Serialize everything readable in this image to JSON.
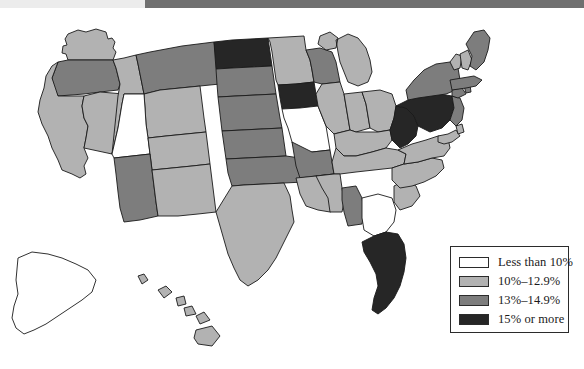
{
  "chart_data": {
    "type": "map",
    "title": "",
    "map_region": "United States",
    "value_label": "percent",
    "legend": {
      "position": "bottom-right",
      "bins": [
        {
          "label": "Less than 10%",
          "color": "#ffffff",
          "range": [
            0,
            9.9
          ]
        },
        {
          "label": "10%–12.9%",
          "color": "#b2b2b2",
          "range": [
            10,
            12.9
          ]
        },
        {
          "label": "13%–14.9%",
          "color": "#7d7d7d",
          "range": [
            13,
            14.9
          ]
        },
        {
          "label": "15% or more",
          "color": "#262626",
          "range": [
            15,
            100
          ]
        }
      ]
    },
    "states": [
      {
        "code": "AL",
        "name": "Alabama",
        "bin": 2,
        "color": "#7d7d7d"
      },
      {
        "code": "AK",
        "name": "Alaska",
        "bin": 0,
        "color": "#ffffff"
      },
      {
        "code": "AZ",
        "name": "Arizona",
        "bin": 2,
        "color": "#7d7d7d"
      },
      {
        "code": "AR",
        "name": "Arkansas",
        "bin": 2,
        "color": "#7d7d7d"
      },
      {
        "code": "CA",
        "name": "California",
        "bin": 1,
        "color": "#b2b2b2"
      },
      {
        "code": "CO",
        "name": "Colorado",
        "bin": 1,
        "color": "#b2b2b2"
      },
      {
        "code": "CT",
        "name": "Connecticut",
        "bin": 2,
        "color": "#7d7d7d"
      },
      {
        "code": "DE",
        "name": "Delaware",
        "bin": 1,
        "color": "#b2b2b2"
      },
      {
        "code": "FL",
        "name": "Florida",
        "bin": 3,
        "color": "#262626"
      },
      {
        "code": "GA",
        "name": "Georgia",
        "bin": 0,
        "color": "#ffffff"
      },
      {
        "code": "HI",
        "name": "Hawaii",
        "bin": 1,
        "color": "#b2b2b2"
      },
      {
        "code": "ID",
        "name": "Idaho",
        "bin": 1,
        "color": "#b2b2b2"
      },
      {
        "code": "IL",
        "name": "Illinois",
        "bin": 1,
        "color": "#b2b2b2"
      },
      {
        "code": "IN",
        "name": "Indiana",
        "bin": 1,
        "color": "#b2b2b2"
      },
      {
        "code": "IA",
        "name": "Iowa",
        "bin": 3,
        "color": "#262626"
      },
      {
        "code": "KS",
        "name": "Kansas",
        "bin": 2,
        "color": "#7d7d7d"
      },
      {
        "code": "KY",
        "name": "Kentucky",
        "bin": 1,
        "color": "#b2b2b2"
      },
      {
        "code": "LA",
        "name": "Louisiana",
        "bin": 1,
        "color": "#b2b2b2"
      },
      {
        "code": "ME",
        "name": "Maine",
        "bin": 2,
        "color": "#7d7d7d"
      },
      {
        "code": "MD",
        "name": "Maryland",
        "bin": 1,
        "color": "#b2b2b2"
      },
      {
        "code": "MA",
        "name": "Massachusetts",
        "bin": 2,
        "color": "#7d7d7d"
      },
      {
        "code": "MI",
        "name": "Michigan",
        "bin": 1,
        "color": "#b2b2b2"
      },
      {
        "code": "MN",
        "name": "Minnesota",
        "bin": 1,
        "color": "#b2b2b2"
      },
      {
        "code": "MS",
        "name": "Mississippi",
        "bin": 1,
        "color": "#b2b2b2"
      },
      {
        "code": "MO",
        "name": "Missouri",
        "bin": 0,
        "color": "#ffffff"
      },
      {
        "code": "MT",
        "name": "Montana",
        "bin": 2,
        "color": "#7d7d7d"
      },
      {
        "code": "NE",
        "name": "Nebraska",
        "bin": 2,
        "color": "#7d7d7d"
      },
      {
        "code": "NV",
        "name": "Nevada",
        "bin": 1,
        "color": "#b2b2b2"
      },
      {
        "code": "NH",
        "name": "New Hampshire",
        "bin": 1,
        "color": "#b2b2b2"
      },
      {
        "code": "NJ",
        "name": "New Jersey",
        "bin": 2,
        "color": "#7d7d7d"
      },
      {
        "code": "NM",
        "name": "New Mexico",
        "bin": 1,
        "color": "#b2b2b2"
      },
      {
        "code": "NY",
        "name": "New York",
        "bin": 2,
        "color": "#7d7d7d"
      },
      {
        "code": "NC",
        "name": "North Carolina",
        "bin": 1,
        "color": "#b2b2b2"
      },
      {
        "code": "ND",
        "name": "North Dakota",
        "bin": 3,
        "color": "#262626"
      },
      {
        "code": "OH",
        "name": "Ohio",
        "bin": 1,
        "color": "#b2b2b2"
      },
      {
        "code": "OK",
        "name": "Oklahoma",
        "bin": 2,
        "color": "#7d7d7d"
      },
      {
        "code": "OR",
        "name": "Oregon",
        "bin": 2,
        "color": "#7d7d7d"
      },
      {
        "code": "PA",
        "name": "Pennsylvania",
        "bin": 3,
        "color": "#262626"
      },
      {
        "code": "RI",
        "name": "Rhode Island",
        "bin": 2,
        "color": "#7d7d7d"
      },
      {
        "code": "SC",
        "name": "South Carolina",
        "bin": 1,
        "color": "#b2b2b2"
      },
      {
        "code": "SD",
        "name": "South Dakota",
        "bin": 2,
        "color": "#7d7d7d"
      },
      {
        "code": "TN",
        "name": "Tennessee",
        "bin": 1,
        "color": "#b2b2b2"
      },
      {
        "code": "TX",
        "name": "Texas",
        "bin": 1,
        "color": "#b2b2b2"
      },
      {
        "code": "UT",
        "name": "Utah",
        "bin": 0,
        "color": "#ffffff"
      },
      {
        "code": "VT",
        "name": "Vermont",
        "bin": 1,
        "color": "#b2b2b2"
      },
      {
        "code": "VA",
        "name": "Virginia",
        "bin": 1,
        "color": "#b2b2b2"
      },
      {
        "code": "WA",
        "name": "Washington",
        "bin": 1,
        "color": "#b2b2b2"
      },
      {
        "code": "WV",
        "name": "West Virginia",
        "bin": 3,
        "color": "#262626"
      },
      {
        "code": "WI",
        "name": "Wisconsin",
        "bin": 2,
        "color": "#7d7d7d"
      },
      {
        "code": "WY",
        "name": "Wyoming",
        "bin": 1,
        "color": "#b2b2b2"
      }
    ]
  },
  "legend": {
    "rows": [
      {
        "label": "Less than 10%",
        "color": "#ffffff"
      },
      {
        "label": "10%–12.9%",
        "color": "#b2b2b2"
      },
      {
        "label": "13%–14.9%",
        "color": "#7d7d7d"
      },
      {
        "label": "15% or more",
        "color": "#262626"
      }
    ]
  },
  "colors": {
    "bin0": "#ffffff",
    "bin1": "#b2b2b2",
    "bin2": "#7d7d7d",
    "bin3": "#262626",
    "outline": "#1a1a1a",
    "top_bar": "#707070",
    "page_background": "#ffffff"
  }
}
